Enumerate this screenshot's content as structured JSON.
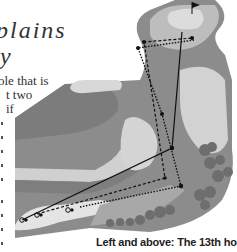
{
  "title": {
    "line1": "plains",
    "line2": "y"
  },
  "body_text": [
    "ole that is",
    "t two",
    "if"
  ],
  "caption": "Left and above: The 13th hole",
  "map": {
    "description": "Golf hole layout illustration showing tee, fairway, bunkers, trees and green with flag",
    "tee_markers": [
      "tee-marker",
      "tee-marker",
      "tee-marker"
    ],
    "colors": {
      "rough": "#8c8c8c",
      "dark_rough": "#7a7a7a",
      "fairway": "#b4b4b4",
      "light_fairway": "#d8d8d8",
      "tee_box": "#e8e8e8",
      "trees": "#6e6e6e",
      "lines": "#111111"
    }
  }
}
